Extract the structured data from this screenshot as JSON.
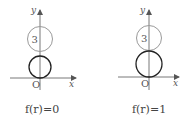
{
  "figures": [
    {
      "id": "left",
      "caption": "f(r)=0",
      "axis_x_label": "x",
      "axis_y_label": "y",
      "origin_label": "O",
      "upper_circle_label": "3",
      "colors": {
        "upper_circle": "#9a9a9a",
        "lower_circle": "#222222",
        "axis": "#555555"
      }
    },
    {
      "id": "right",
      "caption": "f(r)=1",
      "axis_x_label": "x",
      "axis_y_label": "y",
      "origin_label": "O",
      "upper_circle_label": "3",
      "colors": {
        "upper_circle": "#9a9a9a",
        "lower_circle": "#222222",
        "axis": "#555555"
      }
    }
  ]
}
